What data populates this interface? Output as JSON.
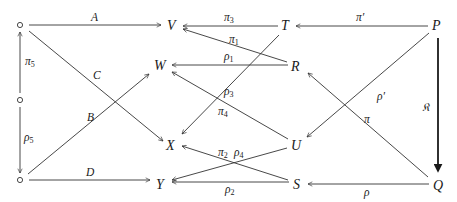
{
  "diagram": {
    "type": "commutative-diagram",
    "nodes": {
      "o1": {
        "label": "∘",
        "x": 20,
        "y": 25
      },
      "o2": {
        "label": "∘",
        "x": 20,
        "y": 100
      },
      "o3": {
        "label": "∘",
        "x": 20,
        "y": 180
      },
      "V": {
        "label": "V",
        "x": 173,
        "y": 25
      },
      "W": {
        "label": "W",
        "x": 161,
        "y": 65
      },
      "X": {
        "label": "X",
        "x": 172,
        "y": 145
      },
      "Y": {
        "label": "Y",
        "x": 162,
        "y": 184
      },
      "T": {
        "label": "T",
        "x": 286,
        "y": 25
      },
      "R": {
        "label": "R",
        "x": 296,
        "y": 66
      },
      "U": {
        "label": "U",
        "x": 297,
        "y": 145
      },
      "S": {
        "label": "S",
        "x": 298,
        "y": 184
      },
      "P": {
        "label": "P",
        "x": 437,
        "y": 25
      },
      "Q": {
        "label": "Q",
        "x": 438,
        "y": 184
      }
    },
    "edges": [
      {
        "from": "o1",
        "to": "V",
        "label": "A"
      },
      {
        "from": "o1",
        "to": "X",
        "label": "C"
      },
      {
        "from": "o3",
        "to": "W",
        "label": "B"
      },
      {
        "from": "o3",
        "to": "Y",
        "label": "D"
      },
      {
        "from": "o2",
        "to": "o1",
        "label": "π5"
      },
      {
        "from": "o2",
        "to": "o3",
        "label": "ρ5"
      },
      {
        "from": "T",
        "to": "V",
        "label": "π3"
      },
      {
        "from": "R",
        "to": "V",
        "label": "π1"
      },
      {
        "from": "R",
        "to": "W",
        "label": "ρ1"
      },
      {
        "from": "T",
        "to": "X",
        "label": "ρ3"
      },
      {
        "from": "U",
        "to": "W",
        "label": "π4"
      },
      {
        "from": "S",
        "to": "X",
        "label": "π2"
      },
      {
        "from": "U",
        "to": "Y",
        "label": "ρ4"
      },
      {
        "from": "S",
        "to": "Y",
        "label": "ρ2"
      },
      {
        "from": "P",
        "to": "T",
        "label": "π′"
      },
      {
        "from": "P",
        "to": "U",
        "label": "ρ′"
      },
      {
        "from": "Q",
        "to": "R",
        "label": "π"
      },
      {
        "from": "Q",
        "to": "S",
        "label": "ρ"
      },
      {
        "from": "P",
        "to": "Q",
        "label": "𝔎",
        "style": "bold"
      }
    ]
  },
  "labels": {
    "A": "A",
    "B": "B",
    "C": "C",
    "D": "D",
    "pi5": "π",
    "pi5_sub": "5",
    "rho5": "ρ",
    "rho5_sub": "5",
    "pi3": "π",
    "pi3_sub": "3",
    "pi1": "π",
    "pi1_sub": "1",
    "rho1": "ρ",
    "rho1_sub": "1",
    "rho3": "ρ",
    "rho3_sub": "3",
    "pi4": "π",
    "pi4_sub": "4",
    "pi2": "π",
    "pi2_sub": "2",
    "rho4": "ρ",
    "rho4_sub": "4",
    "rho2": "ρ",
    "rho2_sub": "2",
    "pi_prime": "π′",
    "rho_prime": "ρ′",
    "pi": "π",
    "rho": "ρ",
    "frak_K": "𝔎"
  },
  "node_labels": {
    "V": "V",
    "W": "W",
    "X": "X",
    "Y": "Y",
    "T": "T",
    "R": "R",
    "U": "U",
    "S": "S",
    "P": "P",
    "Q": "Q"
  },
  "colors": {
    "stroke": "#333333",
    "text": "#1a1a1a",
    "background": "#ffffff"
  }
}
